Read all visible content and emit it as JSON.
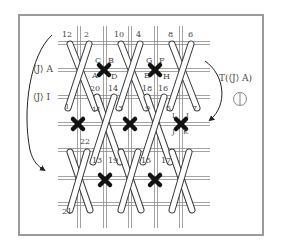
{
  "figure": {
    "left_labels": {
      "upper": "⟨J⟩ A",
      "lower": "⟨J⟩ I"
    },
    "right_label": "T(⟨J⟩ A)",
    "right_symbol": "circled-vertical-line",
    "colors": {
      "frame": "#9a9a9a",
      "grid": "#8c8c8c",
      "stick_outline": "#3a3a3a",
      "stick_fill": "#ffffff",
      "marker": "#111111"
    },
    "grid": {
      "vertical_x": [
        79,
        105,
        130,
        156,
        181
      ],
      "horizontal_y": [
        43,
        70,
        97,
        124,
        150,
        178,
        204
      ]
    },
    "stick_numbers": {
      "top_row": [
        "12",
        "2",
        "10",
        "4",
        "8",
        "6"
      ],
      "second_row_top": [
        "20",
        "14",
        "18",
        "16"
      ],
      "second_row_side": [
        "1",
        "11",
        "3",
        "9",
        "5",
        "7"
      ],
      "third_row": [
        "22",
        "13",
        "19",
        "15",
        "17",
        "21"
      ]
    },
    "marker_letters": {
      "marker1": [
        "C",
        "B",
        "A",
        "D"
      ],
      "marker2": [
        "G",
        "F",
        "E",
        "H"
      ],
      "marker3": [
        "I",
        "J",
        "K",
        "L"
      ]
    }
  }
}
